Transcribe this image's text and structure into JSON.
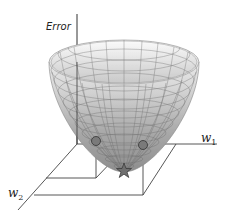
{
  "diagram": {
    "title": "",
    "type": "error-surface",
    "labels": {
      "vertical_axis": "Error",
      "w1_main": "w",
      "w1_sub": "1",
      "w2_main": "w",
      "w2_sub": "2"
    },
    "markers": [
      {
        "shape": "circle",
        "name": "sample-point-1"
      },
      {
        "shape": "circle",
        "name": "sample-point-2"
      },
      {
        "shape": "star",
        "name": "minimum-point"
      }
    ],
    "colors": {
      "axis": "#333333",
      "surface_light": "#f4f4f4",
      "surface_dark": "#8a8a8a",
      "grid": "#666666",
      "marker": "#777777"
    }
  }
}
